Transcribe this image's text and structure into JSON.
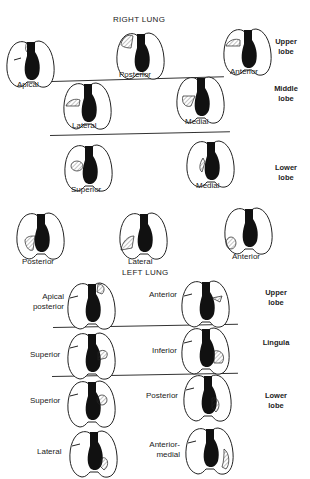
{
  "right_lung": {
    "title": "RIGHT LUNG",
    "upper_lobe": {
      "label": "Upper lobe",
      "segments": [
        "Apical",
        "Posterior",
        "Anterior"
      ]
    },
    "middle_lobe": {
      "label": "Middle lobe",
      "segments": [
        "Lateral",
        "Medial"
      ]
    },
    "lower_lobe": {
      "label": "Lower lobe",
      "segments": [
        "Superior",
        "Medial",
        "Posterior",
        "Lateral",
        "Anterior"
      ]
    }
  },
  "left_lung": {
    "title": "LEFT LUNG",
    "upper_lobe": {
      "label": "Upper lobe",
      "segments": [
        "Apical posterior",
        "Anterior"
      ]
    },
    "lingula": {
      "label": "Lingula",
      "segments": [
        "Superior",
        "Inferior"
      ]
    },
    "lower_lobe": {
      "label": "Lower lobe",
      "segments": [
        "Superior",
        "Posterior",
        "Lateral",
        "Anterior-medial"
      ]
    }
  },
  "colors": {
    "ink": "#222222",
    "heart": "#111111",
    "background": "#ffffff"
  }
}
